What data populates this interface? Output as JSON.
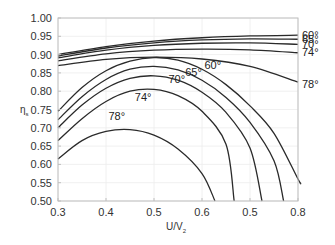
{
  "chart_data": {
    "type": "line",
    "title": "",
    "xlabel": "U/V2",
    "xlabel_main": "U/V",
    "xlabel_sub": "2",
    "ylabel": "ηs",
    "ylabel_main": "η",
    "ylabel_sub": "s",
    "xlim": [
      0.3,
      0.8
    ],
    "ylim": [
      0.5,
      1.0
    ],
    "grid": true,
    "x_ticks": [
      0.3,
      0.4,
      0.5,
      0.6,
      0.7,
      0.8
    ],
    "x_tick_labels": [
      "0.3",
      "0.4",
      "0.5",
      "0.6",
      "0.5",
      "0.8"
    ],
    "y_ticks": [
      0.5,
      0.55,
      0.6,
      0.65,
      0.7,
      0.75,
      0.8,
      0.85,
      0.9,
      0.95,
      1.0
    ],
    "y_tick_labels": [
      "0.50",
      "0.55",
      "0.60",
      "0.65",
      "0.70",
      "0.75",
      "0.80",
      "0.85",
      "0.90",
      "0.95",
      "1.00"
    ],
    "series": [
      {
        "name": "60° (upper)",
        "group": "upper",
        "x": [
          0.3,
          0.4,
          0.5,
          0.6,
          0.7,
          0.8
        ],
        "y": [
          0.9,
          0.922,
          0.937,
          0.946,
          0.951,
          0.953
        ]
      },
      {
        "name": "65° (upper)",
        "group": "upper",
        "x": [
          0.3,
          0.4,
          0.5,
          0.6,
          0.7,
          0.8
        ],
        "y": [
          0.896,
          0.918,
          0.932,
          0.94,
          0.943,
          0.942
        ]
      },
      {
        "name": "70° (upper)",
        "group": "upper",
        "x": [
          0.3,
          0.4,
          0.5,
          0.6,
          0.7,
          0.8
        ],
        "y": [
          0.891,
          0.912,
          0.925,
          0.931,
          0.932,
          0.928
        ]
      },
      {
        "name": "74° (upper)",
        "group": "upper",
        "x": [
          0.3,
          0.4,
          0.5,
          0.6,
          0.7,
          0.8
        ],
        "y": [
          0.883,
          0.902,
          0.912,
          0.915,
          0.913,
          0.905
        ]
      },
      {
        "name": "78° (upper)",
        "group": "upper",
        "x": [
          0.3,
          0.4,
          0.5,
          0.6,
          0.7,
          0.8
        ],
        "y": [
          0.87,
          0.887,
          0.893,
          0.888,
          0.868,
          0.825
        ]
      },
      {
        "name": "60° (lower)",
        "group": "lower",
        "x": [
          0.3,
          0.35,
          0.4,
          0.45,
          0.5,
          0.55,
          0.6,
          0.65,
          0.7,
          0.75,
          0.8,
          0.805
        ],
        "y": [
          0.745,
          0.81,
          0.856,
          0.882,
          0.892,
          0.885,
          0.86,
          0.818,
          0.76,
          0.685,
          0.56,
          0.55
        ]
      },
      {
        "name": "65° (lower)",
        "group": "lower",
        "x": [
          0.3,
          0.35,
          0.4,
          0.45,
          0.5,
          0.55,
          0.6,
          0.65,
          0.7,
          0.75,
          0.77
        ],
        "y": [
          0.722,
          0.785,
          0.832,
          0.86,
          0.868,
          0.858,
          0.83,
          0.783,
          0.715,
          0.61,
          0.5
        ]
      },
      {
        "name": "70° (lower)",
        "group": "lower",
        "x": [
          0.3,
          0.35,
          0.4,
          0.45,
          0.5,
          0.55,
          0.6,
          0.65,
          0.7,
          0.725
        ],
        "y": [
          0.7,
          0.762,
          0.808,
          0.835,
          0.842,
          0.83,
          0.797,
          0.742,
          0.645,
          0.5
        ]
      },
      {
        "name": "74° (lower)",
        "group": "lower",
        "x": [
          0.3,
          0.35,
          0.4,
          0.45,
          0.5,
          0.55,
          0.6,
          0.65,
          0.667
        ],
        "y": [
          0.665,
          0.725,
          0.772,
          0.8,
          0.805,
          0.788,
          0.745,
          0.655,
          0.5
        ]
      },
      {
        "name": "78° (lower)",
        "group": "lower",
        "x": [
          0.3,
          0.35,
          0.4,
          0.45,
          0.5,
          0.55,
          0.6,
          0.627
        ],
        "y": [
          0.615,
          0.665,
          0.69,
          0.695,
          0.68,
          0.642,
          0.575,
          0.5
        ]
      }
    ],
    "annotations": [
      {
        "text": "60°",
        "x": 0.8,
        "y": 0.953,
        "placement": "right-of-axis"
      },
      {
        "text": "65°",
        "x": 0.8,
        "y": 0.942,
        "placement": "right-of-axis"
      },
      {
        "text": "70°",
        "x": 0.8,
        "y": 0.928,
        "placement": "right-of-axis"
      },
      {
        "text": "74°",
        "x": 0.8,
        "y": 0.908,
        "placement": "right-of-axis"
      },
      {
        "text": "78°",
        "x": 0.8,
        "y": 0.82,
        "placement": "right-of-axis"
      },
      {
        "text": "60°",
        "x": 0.605,
        "y": 0.862,
        "placement": "inside"
      },
      {
        "text": "65°",
        "x": 0.565,
        "y": 0.842,
        "placement": "inside"
      },
      {
        "text": "70°",
        "x": 0.53,
        "y": 0.823,
        "placement": "inside"
      },
      {
        "text": "74°",
        "x": 0.46,
        "y": 0.774,
        "placement": "inside"
      },
      {
        "text": "78°",
        "x": 0.405,
        "y": 0.72,
        "placement": "inside"
      }
    ]
  }
}
